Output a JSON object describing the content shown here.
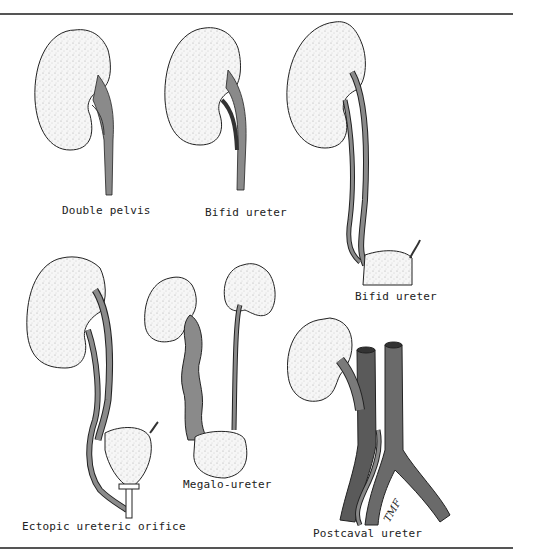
{
  "figure": {
    "panels": [
      {
        "id": "double-pelvis",
        "label": "Double pelvis"
      },
      {
        "id": "bifid-ureter-1",
        "label": "Bifid ureter"
      },
      {
        "id": "bifid-ureter-2",
        "label": "Bifid ureter"
      },
      {
        "id": "ectopic-ureteric-orifice",
        "label": "Ectopic ureteric orifice"
      },
      {
        "id": "megalo-ureter",
        "label": "Megalo-ureter"
      },
      {
        "id": "postcaval-ureter",
        "label": "Postcaval ureter"
      }
    ],
    "signature": "TMF",
    "colors": {
      "kidney_fill": "#f4f4f4",
      "ureter_fill": "#8a8a8a",
      "vessel_fill": "#6a6a6a",
      "outline": "#222222",
      "rule": "#555555"
    }
  }
}
